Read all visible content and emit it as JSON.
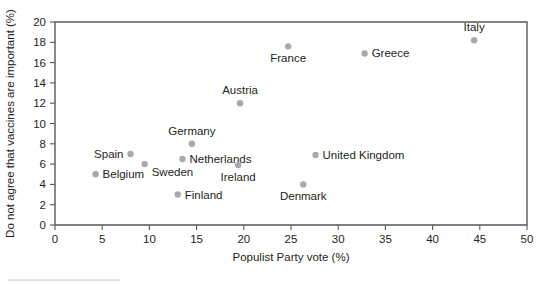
{
  "chart_data": {
    "type": "scatter",
    "title": "",
    "xlabel": "Populist Party vote (%)",
    "ylabel": "Do not agree that vaccines are important (%)",
    "xlim": [
      0,
      50
    ],
    "ylim": [
      0,
      20
    ],
    "xticks": [
      0,
      5,
      10,
      15,
      20,
      25,
      30,
      35,
      40,
      45,
      50
    ],
    "yticks": [
      0,
      2,
      4,
      6,
      8,
      10,
      12,
      14,
      16,
      18,
      20
    ],
    "xtick_labels": [
      "0",
      "5",
      "10",
      "15",
      "20",
      "25",
      "30",
      "35",
      "40",
      "45",
      "50"
    ],
    "ytick_labels": [
      "0",
      "2",
      "4",
      "6",
      "8",
      "10",
      "12",
      "14",
      "16",
      "18",
      "20"
    ],
    "grid": false,
    "legend": "none",
    "marker_color": "#a7a9ac",
    "axis_color": "#58585b",
    "points": [
      {
        "label": "Belgium",
        "x": 4.3,
        "y": 5.0,
        "label_pos": "right"
      },
      {
        "label": "Spain",
        "x": 8.0,
        "y": 7.0,
        "label_pos": "left"
      },
      {
        "label": "Sweden",
        "x": 9.5,
        "y": 6.0,
        "label_pos": "below-right"
      },
      {
        "label": "Finland",
        "x": 13.0,
        "y": 3.0,
        "label_pos": "right"
      },
      {
        "label": "Netherlands",
        "x": 13.5,
        "y": 6.5,
        "label_pos": "right"
      },
      {
        "label": "Germany",
        "x": 14.5,
        "y": 8.0,
        "label_pos": "above"
      },
      {
        "label": "Ireland",
        "x": 19.4,
        "y": 5.9,
        "label_pos": "below"
      },
      {
        "label": "Austria",
        "x": 19.6,
        "y": 12.0,
        "label_pos": "above"
      },
      {
        "label": "France",
        "x": 24.7,
        "y": 17.6,
        "label_pos": "below"
      },
      {
        "label": "Denmark",
        "x": 26.3,
        "y": 4.0,
        "label_pos": "below"
      },
      {
        "label": "United Kingdom",
        "x": 27.6,
        "y": 6.9,
        "label_pos": "right"
      },
      {
        "label": "Greece",
        "x": 32.8,
        "y": 16.9,
        "label_pos": "right"
      },
      {
        "label": "Italy",
        "x": 44.4,
        "y": 18.2,
        "label_pos": "above"
      }
    ]
  }
}
